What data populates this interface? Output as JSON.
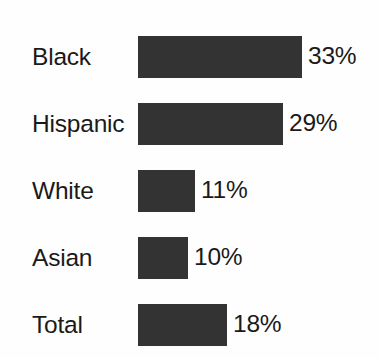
{
  "chart_data": {
    "type": "bar",
    "orientation": "horizontal",
    "title": "",
    "subtitle": "",
    "xlabel": "",
    "ylabel": "",
    "categories": [
      "Black",
      "Hispanic",
      "White",
      "Asian",
      "Total"
    ],
    "values": [
      33,
      29,
      11,
      10,
      18
    ],
    "value_labels": [
      "33%",
      "29%",
      "11%",
      "10%",
      "18%"
    ],
    "value_unit": "%",
    "xlim": [
      0,
      33
    ],
    "grid": false,
    "legend": false,
    "axis_visible": false,
    "tick_labels": [],
    "annotations": [],
    "bar_color": "#333333",
    "background_color": "#fefefe",
    "text_color": "#1a1a1a",
    "rows": [
      {
        "label": "Black",
        "value": 33,
        "value_label": "33%",
        "bar_px": 164
      },
      {
        "label": "Hispanic",
        "value": 29,
        "value_label": "29%",
        "bar_px": 145
      },
      {
        "label": "White",
        "value": 11,
        "value_label": "11%",
        "bar_px": 57
      },
      {
        "label": "Asian",
        "value": 10,
        "value_label": "10%",
        "bar_px": 50
      },
      {
        "label": "Total",
        "value": 18,
        "value_label": "18%",
        "bar_px": 89
      }
    ]
  }
}
